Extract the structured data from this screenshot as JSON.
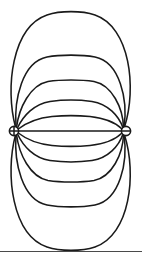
{
  "figure": {
    "title": "Electric dipole field lines",
    "type": "field-line-diagram",
    "width": 142,
    "height": 261,
    "background_color": "#ffffff",
    "line_color": "#1a1a1a",
    "rule_color": "#4a4a4a"
  },
  "charges": [
    {
      "id": "positive-charge",
      "label": "+",
      "sign": "positive",
      "glyph": "plus-in-circle",
      "cx": 14,
      "cy": 131,
      "r": 4.6
    },
    {
      "id": "negative-charge",
      "label": "−",
      "sign": "negative",
      "glyph": "minus-in-circle",
      "cx": 126,
      "cy": 131,
      "r": 4.6
    }
  ],
  "axis": {
    "label": "dipole axis",
    "path": "M 18.6 131 L 121.4 131"
  },
  "field_lines": {
    "count": 11,
    "above_axis": 5,
    "below_axis": 5,
    "on_axis": 1,
    "paths": [
      {
        "name": "field-line-upper-5",
        "side": "above",
        "rank": 5,
        "apex_y": 13,
        "d": "M 15.5 127 C 5 88, 12 27, 47 15 C 60 10.5, 82 10.5, 95 15 C 130 27, 137 88, 124.5 127"
      },
      {
        "name": "field-line-upper-4",
        "side": "above",
        "rank": 4,
        "apex_y": 56,
        "d": "M 16 127 C 14 100, 22 62, 47 57 C 60 54.5, 82 54.5, 95 57 C 120 62, 128 100, 124 127"
      },
      {
        "name": "field-line-upper-3",
        "side": "above",
        "rank": 3,
        "apex_y": 81,
        "d": "M 16.5 127.5 C 19 108, 30 85, 48 81.5 C 61 79.5, 81 79.5, 94 81.5 C 112 85, 123 108, 123.5 127.5"
      },
      {
        "name": "field-line-upper-2",
        "side": "above",
        "rank": 2,
        "apex_y": 101,
        "d": "M 17.5 128 C 23 116, 34 104, 50 101.5 C 62 99.8, 80 99.8, 92 101.5 C 108 104, 119 116, 123 128"
      },
      {
        "name": "field-line-upper-1",
        "side": "above",
        "rank": 1,
        "apex_y": 116,
        "d": "M 18.3 129 C 26 123, 38 118, 52 116.5 C 63 115.5, 79 115.5, 90 116.5 C 104 118, 116 123, 122 129"
      },
      {
        "name": "field-line-lower-1",
        "side": "below",
        "rank": 1,
        "apex_y": 146,
        "d": "M 18.3 133 C 26 139, 38 144, 52 145.5 C 63 146.5, 79 146.5, 90 145.5 C 104 144, 116 139, 122 133"
      },
      {
        "name": "field-line-lower-2",
        "side": "below",
        "rank": 2,
        "apex_y": 161,
        "d": "M 17.5 134 C 23 146, 34 158, 50 160.5 C 62 162.2, 80 162.2, 92 160.5 C 108 158, 119 146, 123 134"
      },
      {
        "name": "field-line-lower-3",
        "side": "below",
        "rank": 3,
        "apex_y": 181,
        "d": "M 16.5 134.5 C 19 154, 30 177, 48 180.5 C 61 182.5, 81 182.5, 94 180.5 C 112 177, 123 154, 123.5 134.5"
      },
      {
        "name": "field-line-lower-4",
        "side": "below",
        "rank": 4,
        "apex_y": 206,
        "d": "M 16 135 C 14 162, 22 200, 47 205 C 60 207.5, 82 207.5, 95 205 C 120 200, 128 162, 124 135"
      },
      {
        "name": "field-line-lower-5",
        "side": "below",
        "rank": 5,
        "apex_y": 247,
        "d": "M 15.5 135 C 5 174, 12 235, 47 247 C 60 251.5, 82 251.5, 95 247 C 130 235, 137 174, 124.5 135"
      }
    ]
  },
  "footer_rule": {
    "name": "footer-divider",
    "y": 251,
    "visible": true
  }
}
